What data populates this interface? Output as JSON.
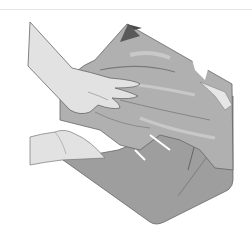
{
  "image": {
    "description": "Grayscale line illustration of two hands pressing crumpled paper/fabric into an open box",
    "colors": {
      "background": "#ffffff",
      "box_floor": "#9e9e9e",
      "box_shadow": "#8a8a8a",
      "crumple_mid": "#b0b0b0",
      "crumple_light": "#c8c8c8",
      "crumple_dark": "#7a7a7a",
      "skin": "#e2e2e2",
      "outline": "#555555",
      "flap_dark": "#4a4a4a"
    }
  }
}
